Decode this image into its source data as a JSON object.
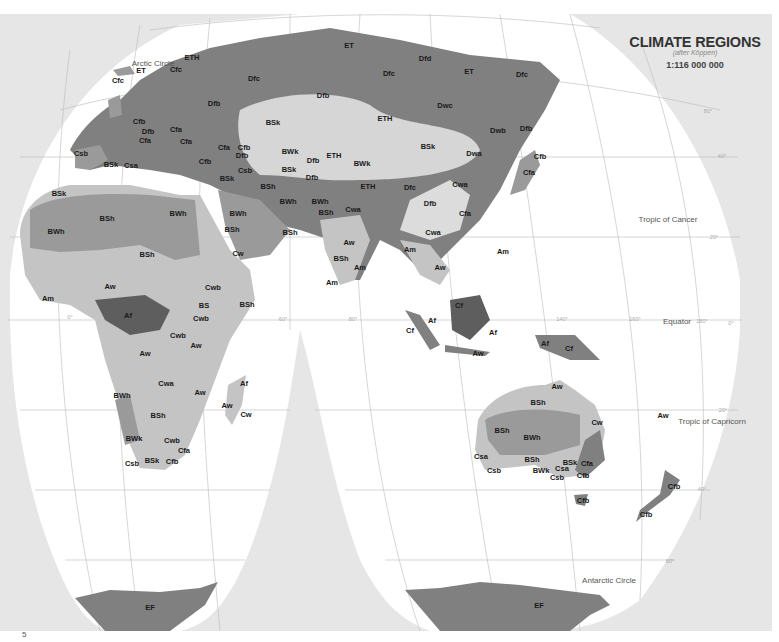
{
  "title": {
    "heading": "CLIMATE REGIONS",
    "subheading": "(after Köppen)",
    "scale": "1:116 000 000"
  },
  "colors": {
    "outside_projection": "#e6e6e6",
    "ocean": "#ffffff",
    "graticule": "#bbbbbb",
    "tone_darkest": "#5e5e5e",
    "tone_dark": "#808080",
    "tone_mid": "#9a9a9a",
    "tone_light": "#c4c4c4",
    "tone_lightest": "#dcdcdc",
    "label_text": "#1a1a1a"
  },
  "reference_lines": [
    {
      "name": "arctic-circle",
      "label": "Arctic Circle",
      "x": 153,
      "y": 63
    },
    {
      "name": "tropic-of-cancer",
      "label": "Tropic of Cancer",
      "x": 668,
      "y": 219
    },
    {
      "name": "equator",
      "label": "Equator",
      "x": 677,
      "y": 321
    },
    {
      "name": "tropic-of-capricorn",
      "label": "Tropic of Capricorn",
      "x": 712,
      "y": 421
    },
    {
      "name": "antarctic-circle",
      "label": "Antarctic Circle",
      "x": 609,
      "y": 580
    }
  ],
  "degree_labels": [
    {
      "label": "80°",
      "x": 708,
      "y": 111
    },
    {
      "label": "40°",
      "x": 722,
      "y": 156
    },
    {
      "label": "20°",
      "x": 714,
      "y": 237
    },
    {
      "label": "0°",
      "x": 70,
      "y": 317
    },
    {
      "label": "60°",
      "x": 283,
      "y": 319
    },
    {
      "label": "80°",
      "x": 353,
      "y": 319
    },
    {
      "label": "140°",
      "x": 562,
      "y": 319
    },
    {
      "label": "160°",
      "x": 635,
      "y": 319
    },
    {
      "label": "180°",
      "x": 702,
      "y": 321
    },
    {
      "label": "0°",
      "x": 731,
      "y": 323
    },
    {
      "label": "20°",
      "x": 723,
      "y": 410
    },
    {
      "label": "40°",
      "x": 702,
      "y": 489
    },
    {
      "label": "60°",
      "x": 670,
      "y": 561
    }
  ],
  "climate_labels": [
    {
      "code": "ET",
      "x": 141,
      "y": 70
    },
    {
      "code": "Cfc",
      "x": 118,
      "y": 80
    },
    {
      "code": "ETH",
      "x": 192,
      "y": 57
    },
    {
      "code": "Cfc",
      "x": 176,
      "y": 69
    },
    {
      "code": "Dfc",
      "x": 254,
      "y": 78
    },
    {
      "code": "Dfb",
      "x": 214,
      "y": 103
    },
    {
      "code": "ET",
      "x": 349,
      "y": 45
    },
    {
      "code": "Dfd",
      "x": 425,
      "y": 58
    },
    {
      "code": "Dfc",
      "x": 389,
      "y": 73
    },
    {
      "code": "ET",
      "x": 469,
      "y": 71
    },
    {
      "code": "Dfc",
      "x": 522,
      "y": 74
    },
    {
      "code": "Dfb",
      "x": 323,
      "y": 95
    },
    {
      "code": "Dwc",
      "x": 445,
      "y": 105
    },
    {
      "code": "ETH",
      "x": 385,
      "y": 118
    },
    {
      "code": "Dwb",
      "x": 498,
      "y": 130
    },
    {
      "code": "Dfb",
      "x": 526,
      "y": 128
    },
    {
      "code": "BSk",
      "x": 273,
      "y": 122
    },
    {
      "code": "BWk",
      "x": 290,
      "y": 151
    },
    {
      "code": "BSk",
      "x": 428,
      "y": 146
    },
    {
      "code": "Dwa",
      "x": 474,
      "y": 153
    },
    {
      "code": "Cfb",
      "x": 540,
      "y": 156
    },
    {
      "code": "Dfb",
      "x": 313,
      "y": 160
    },
    {
      "code": "ETH",
      "x": 334,
      "y": 155
    },
    {
      "code": "BWk",
      "x": 362,
      "y": 163
    },
    {
      "code": "Cfa",
      "x": 529,
      "y": 172
    },
    {
      "code": "BSk",
      "x": 289,
      "y": 169
    },
    {
      "code": "Dfb",
      "x": 312,
      "y": 177
    },
    {
      "code": "ETH",
      "x": 368,
      "y": 186
    },
    {
      "code": "Dfc",
      "x": 410,
      "y": 187
    },
    {
      "code": "Cwa",
      "x": 460,
      "y": 184
    },
    {
      "code": "Dfb",
      "x": 430,
      "y": 203
    },
    {
      "code": "Cfa",
      "x": 465,
      "y": 213
    },
    {
      "code": "Cfb",
      "x": 139,
      "y": 121
    },
    {
      "code": "Dfb",
      "x": 148,
      "y": 131
    },
    {
      "code": "Cfa",
      "x": 176,
      "y": 129
    },
    {
      "code": "Cfa",
      "x": 145,
      "y": 140
    },
    {
      "code": "Cfa",
      "x": 186,
      "y": 141
    },
    {
      "code": "Cfa",
      "x": 224,
      "y": 147
    },
    {
      "code": "Cfb",
      "x": 244,
      "y": 147
    },
    {
      "code": "Dfb",
      "x": 242,
      "y": 155
    },
    {
      "code": "Cfb",
      "x": 205,
      "y": 161
    },
    {
      "code": "Csb",
      "x": 245,
      "y": 170
    },
    {
      "code": "Csb",
      "x": 81,
      "y": 153
    },
    {
      "code": "BSk",
      "x": 111,
      "y": 164
    },
    {
      "code": "Csa",
      "x": 131,
      "y": 165
    },
    {
      "code": "BSk",
      "x": 227,
      "y": 178
    },
    {
      "code": "BSh",
      "x": 268,
      "y": 186
    },
    {
      "code": "BWh",
      "x": 288,
      "y": 201
    },
    {
      "code": "BWh",
      "x": 320,
      "y": 201
    },
    {
      "code": "BSh",
      "x": 326,
      "y": 212
    },
    {
      "code": "Cwa",
      "x": 353,
      "y": 209
    },
    {
      "code": "BSk",
      "x": 59,
      "y": 193
    },
    {
      "code": "BWh",
      "x": 178,
      "y": 213
    },
    {
      "code": "BWh",
      "x": 238,
      "y": 213
    },
    {
      "code": "BWh",
      "x": 56,
      "y": 231
    },
    {
      "code": "BSh",
      "x": 107,
      "y": 218
    },
    {
      "code": "BSh",
      "x": 232,
      "y": 229
    },
    {
      "code": "BSh",
      "x": 290,
      "y": 232
    },
    {
      "code": "BSh",
      "x": 147,
      "y": 254
    },
    {
      "code": "Cw",
      "x": 238,
      "y": 253
    },
    {
      "code": "Aw",
      "x": 349,
      "y": 242
    },
    {
      "code": "BSh",
      "x": 341,
      "y": 258
    },
    {
      "code": "Am",
      "x": 360,
      "y": 267
    },
    {
      "code": "Am",
      "x": 332,
      "y": 282
    },
    {
      "code": "Cwa",
      "x": 433,
      "y": 232
    },
    {
      "code": "Am",
      "x": 410,
      "y": 249
    },
    {
      "code": "Aw",
      "x": 440,
      "y": 267
    },
    {
      "code": "Am",
      "x": 503,
      "y": 251
    },
    {
      "code": "Aw",
      "x": 110,
      "y": 286
    },
    {
      "code": "Cwb",
      "x": 213,
      "y": 287
    },
    {
      "code": "BSh",
      "x": 247,
      "y": 304
    },
    {
      "code": "BS",
      "x": 204,
      "y": 305
    },
    {
      "code": "Am",
      "x": 48,
      "y": 298
    },
    {
      "code": "Af",
      "x": 128,
      "y": 315
    },
    {
      "code": "Cwb",
      "x": 201,
      "y": 318
    },
    {
      "code": "Cwb",
      "x": 178,
      "y": 335
    },
    {
      "code": "Aw",
      "x": 196,
      "y": 345
    },
    {
      "code": "Aw",
      "x": 145,
      "y": 353
    },
    {
      "code": "Cf",
      "x": 459,
      "y": 305
    },
    {
      "code": "Af",
      "x": 432,
      "y": 320
    },
    {
      "code": "Cf",
      "x": 410,
      "y": 330
    },
    {
      "code": "Af",
      "x": 493,
      "y": 332
    },
    {
      "code": "Aw",
      "x": 478,
      "y": 353
    },
    {
      "code": "Af",
      "x": 545,
      "y": 343
    },
    {
      "code": "Cf",
      "x": 569,
      "y": 348
    },
    {
      "code": "Cwa",
      "x": 166,
      "y": 383
    },
    {
      "code": "Aw",
      "x": 200,
      "y": 392
    },
    {
      "code": "Af",
      "x": 244,
      "y": 383
    },
    {
      "code": "Aw",
      "x": 227,
      "y": 405
    },
    {
      "code": "Cw",
      "x": 246,
      "y": 414
    },
    {
      "code": "BWh",
      "x": 122,
      "y": 395
    },
    {
      "code": "BSh",
      "x": 158,
      "y": 415
    },
    {
      "code": "BWk",
      "x": 134,
      "y": 438
    },
    {
      "code": "Cwb",
      "x": 172,
      "y": 440
    },
    {
      "code": "Cfa",
      "x": 184,
      "y": 450
    },
    {
      "code": "Csb",
      "x": 132,
      "y": 463
    },
    {
      "code": "BSk",
      "x": 152,
      "y": 460
    },
    {
      "code": "Cfb",
      "x": 172,
      "y": 461
    },
    {
      "code": "Aw",
      "x": 557,
      "y": 386
    },
    {
      "code": "BSh",
      "x": 538,
      "y": 402
    },
    {
      "code": "Cw",
      "x": 597,
      "y": 422
    },
    {
      "code": "Aw",
      "x": 663,
      "y": 415
    },
    {
      "code": "BSh",
      "x": 502,
      "y": 430
    },
    {
      "code": "BWh",
      "x": 532,
      "y": 437
    },
    {
      "code": "Csa",
      "x": 481,
      "y": 456
    },
    {
      "code": "Csb",
      "x": 494,
      "y": 470
    },
    {
      "code": "BSh",
      "x": 532,
      "y": 459
    },
    {
      "code": "BSk",
      "x": 570,
      "y": 462
    },
    {
      "code": "Cfa",
      "x": 587,
      "y": 463
    },
    {
      "code": "Csa",
      "x": 562,
      "y": 468
    },
    {
      "code": "BWk",
      "x": 541,
      "y": 470
    },
    {
      "code": "Csb",
      "x": 557,
      "y": 477
    },
    {
      "code": "Cfb",
      "x": 583,
      "y": 475
    },
    {
      "code": "Cfb",
      "x": 583,
      "y": 500
    },
    {
      "code": "Cfb",
      "x": 674,
      "y": 486
    },
    {
      "code": "Cfb",
      "x": 646,
      "y": 514
    },
    {
      "code": "EF",
      "x": 150,
      "y": 607
    },
    {
      "code": "EF",
      "x": 539,
      "y": 605
    }
  ],
  "footer": {
    "page_mark": "5"
  }
}
